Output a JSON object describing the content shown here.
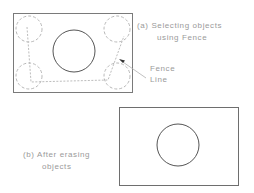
{
  "panel_a": {
    "caption_line1": "(a) Selecting objects",
    "caption_line2": "using Fence",
    "callout_line1": "Fence",
    "callout_line2": "Line"
  },
  "panel_b": {
    "caption_line1": "(b) After erasing",
    "caption_line2": "objects"
  },
  "colors": {
    "outline": "#6e6e6e",
    "dashed": "#b5b5b5",
    "text": "#9a9a9a"
  }
}
